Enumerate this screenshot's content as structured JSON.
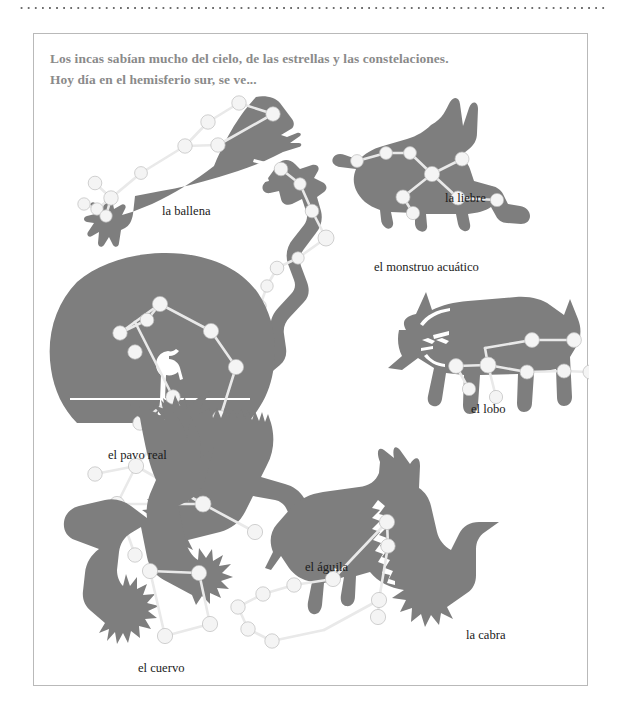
{
  "page": {
    "background_color": "#ffffff",
    "border_color": "#b9b9b9",
    "silhouette_color": "#7e7e7e",
    "star_color": "#f2f2f2",
    "line_color": "#e8e8e8",
    "intro_text_color": "#8a8a8a"
  },
  "intro": {
    "line1": "Los incas sabían mucho del cielo, de las estrellas y las constelaciones.",
    "line2": "Hoy día en el hemisferio sur, se ve..."
  },
  "constellations": [
    {
      "id": "ballena",
      "label": "la ballena",
      "label_x": 128,
      "label_y": 170,
      "stars": 10
    },
    {
      "id": "liebre",
      "label": "la liebre",
      "label_x": 411,
      "label_y": 157,
      "stars": 9
    },
    {
      "id": "monstruo-acuatico",
      "label": "el monstruo acuático",
      "label_x": 340,
      "label_y": 226,
      "stars": 8
    },
    {
      "id": "lobo",
      "label": "el lobo",
      "label_x": 437,
      "label_y": 368,
      "stars": 8
    },
    {
      "id": "pavo-real",
      "label": "el pavo real",
      "label_x": 74,
      "label_y": 414,
      "stars": 9
    },
    {
      "id": "aguila",
      "label": "el águila",
      "label_x": 271,
      "label_y": 526,
      "stars": 6
    },
    {
      "id": "cabra",
      "label": "la cabra",
      "label_x": 432,
      "label_y": 594,
      "stars": 10
    },
    {
      "id": "cuervo",
      "label": "el cuervo",
      "label_x": 104,
      "label_y": 627,
      "stars": 4
    }
  ]
}
